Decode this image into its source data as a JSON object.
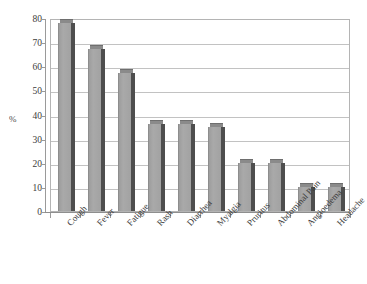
{
  "chart_data": {
    "type": "bar",
    "title": "",
    "xlabel": "",
    "ylabel": "%",
    "ylim": [
      0,
      80
    ],
    "ytick_values": [
      80,
      70,
      60,
      50,
      40,
      30,
      20,
      10,
      0
    ],
    "ytick_labels": [
      "80",
      "70",
      "60",
      "50",
      "40",
      "30",
      "20",
      "10",
      "0"
    ],
    "grid": true,
    "legend": "none",
    "categories": [
      "Cough",
      "Fever",
      "Fatigue",
      "Rash",
      "Diarrhea",
      "Myalgia",
      "Pruritus",
      "Abdominal Pain",
      "Angioedema",
      "Headache"
    ],
    "values": [
      78,
      67,
      57,
      36,
      36,
      35,
      20,
      20,
      10,
      10
    ],
    "series": [
      {
        "name": "Frequency",
        "values": [
          78,
          67,
          57,
          36,
          36,
          35,
          20,
          20,
          10,
          10
        ]
      }
    ]
  },
  "style": {
    "bar_face_color": "#a6a6a6",
    "bar_side_color": "#4e4e4e",
    "bar_top_color": "#8a8a8a",
    "gridline_color": "#c2c2c2",
    "axis_color": "#9a9a9a",
    "plot_border_color": "#b4b4b4",
    "background_color": "#ffffff",
    "text_color": "#3c3c3c"
  }
}
